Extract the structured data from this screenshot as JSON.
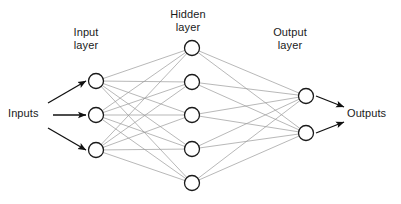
{
  "diagram": {
    "type": "neural-network",
    "labels": {
      "input_layer": "Input\nlayer",
      "hidden_layer": "Hidden\nlayer",
      "output_layer": "Output\nlayer",
      "inputs": "Inputs",
      "outputs": "Outputs"
    },
    "colors": {
      "node_stroke": "#1a1a1a",
      "node_fill": "#ffffff",
      "connection": "#9a9a9a",
      "arrow": "#111111",
      "text": "#1a1a1a",
      "background": "#ffffff"
    },
    "geometry": {
      "node_radius": 7.5,
      "node_stroke_width": 1.3,
      "connection_stroke_width": 0.7,
      "arrow_stroke_width": 1.3
    },
    "layers": [
      {
        "name": "input",
        "label": "Input layer",
        "count": 3,
        "x": 96,
        "nodes_y": [
          81,
          115,
          150
        ]
      },
      {
        "name": "hidden",
        "label": "Hidden layer",
        "count": 5,
        "x": 192,
        "nodes_y": [
          48,
          82,
          115,
          149,
          183
        ]
      },
      {
        "name": "output",
        "label": "Output layer",
        "count": 2,
        "x": 306,
        "nodes_y": [
          96,
          133
        ]
      }
    ],
    "input_arrows": [
      {
        "x1": 48,
        "y1": 103,
        "x2": 86,
        "y2": 81
      },
      {
        "x1": 53,
        "y1": 115,
        "x2": 86,
        "y2": 115
      },
      {
        "x1": 48,
        "y1": 128,
        "x2": 86,
        "y2": 150
      }
    ],
    "output_arrows": [
      {
        "x1": 316,
        "y1": 96,
        "x2": 344,
        "y2": 107
      },
      {
        "x1": 316,
        "y1": 133,
        "x2": 344,
        "y2": 122
      }
    ],
    "connections_note": "fully connected: input(3) x hidden(5) = 15 edges; hidden(5) x output(2) = 10 edges"
  }
}
